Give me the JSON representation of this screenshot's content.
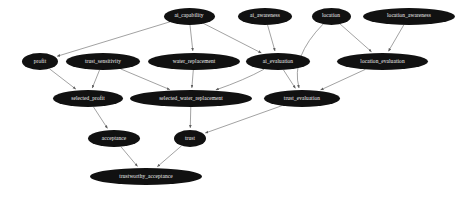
{
  "diagram": {
    "type": "directed-acyclic-graph",
    "background_color": "#ffffff",
    "node_fill_color": "#111111",
    "node_text_color": "#f2f2f2",
    "edge_color": "#7a7a7a",
    "nodes": [
      {
        "id": "ai_capability",
        "label": "ai_capability",
        "cx": 189.0,
        "cy": 16.0,
        "rx": 25.5,
        "ry": 8.5
      },
      {
        "id": "ai_awareness",
        "label": "ai_awareness",
        "cx": 265.0,
        "cy": 16.0,
        "rx": 27.0,
        "ry": 8.5
      },
      {
        "id": "location",
        "label": "location",
        "cx": 331.0,
        "cy": 16.0,
        "rx": 19.5,
        "ry": 8.5
      },
      {
        "id": "location_awareness",
        "label": "location_awareness",
        "cx": 409.0,
        "cy": 16.0,
        "rx": 46.0,
        "ry": 8.5
      },
      {
        "id": "profit",
        "label": "profit",
        "cx": 40.0,
        "cy": 61.5,
        "rx": 18.0,
        "ry": 8.5
      },
      {
        "id": "trust_sensitivity",
        "label": "trust_sensitivity",
        "cx": 103.0,
        "cy": 61.5,
        "rx": 37.0,
        "ry": 8.5
      },
      {
        "id": "water_replacement",
        "label": "water_replacement",
        "cx": 194.0,
        "cy": 61.5,
        "rx": 46.0,
        "ry": 8.5
      },
      {
        "id": "ai_evaluation",
        "label": "ai_evaluation",
        "cx": 278.0,
        "cy": 61.5,
        "rx": 32.0,
        "ry": 8.5
      },
      {
        "id": "location_evaluation",
        "label": "location_evaluation",
        "cx": 382.5,
        "cy": 61.5,
        "rx": 45.5,
        "ry": 8.5
      },
      {
        "id": "selected_profit",
        "label": "selected_profit",
        "cx": 88.0,
        "cy": 98.5,
        "rx": 35.0,
        "ry": 8.5
      },
      {
        "id": "selected_water_replacement",
        "label": "selected_water_replacement",
        "cx": 191.0,
        "cy": 98.5,
        "rx": 61.0,
        "ry": 8.5
      },
      {
        "id": "trust_evaluation",
        "label": "trust_evaluation",
        "cx": 302.0,
        "cy": 98.5,
        "rx": 38.0,
        "ry": 8.5
      },
      {
        "id": "acceptance",
        "label": "acceptance",
        "cx": 114.0,
        "cy": 138.5,
        "rx": 26.0,
        "ry": 8.5
      },
      {
        "id": "trust",
        "label": "trust",
        "cx": 190.0,
        "cy": 138.5,
        "rx": 16.0,
        "ry": 8.5
      },
      {
        "id": "trustworthy_acceptance",
        "label": "trustworthy_acceptance",
        "cx": 146.0,
        "cy": 176.5,
        "rx": 56.0,
        "ry": 8.5
      }
    ],
    "edges": [
      {
        "from": "ai_capability",
        "to": "profit"
      },
      {
        "from": "ai_capability",
        "to": "water_replacement"
      },
      {
        "from": "ai_capability",
        "to": "ai_evaluation"
      },
      {
        "from": "ai_awareness",
        "to": "ai_evaluation"
      },
      {
        "from": "location",
        "to": "location_evaluation"
      },
      {
        "from": "location",
        "to": "trust_evaluation"
      },
      {
        "from": "location_awareness",
        "to": "location_evaluation"
      },
      {
        "from": "profit",
        "to": "selected_profit"
      },
      {
        "from": "trust_sensitivity",
        "to": "selected_profit"
      },
      {
        "from": "trust_sensitivity",
        "to": "selected_water_replacement"
      },
      {
        "from": "water_replacement",
        "to": "selected_water_replacement"
      },
      {
        "from": "ai_evaluation",
        "to": "selected_water_replacement"
      },
      {
        "from": "ai_evaluation",
        "to": "trust_evaluation"
      },
      {
        "from": "location_evaluation",
        "to": "trust_evaluation"
      },
      {
        "from": "selected_profit",
        "to": "acceptance"
      },
      {
        "from": "selected_water_replacement",
        "to": "trust"
      },
      {
        "from": "trust_evaluation",
        "to": "trust"
      },
      {
        "from": "acceptance",
        "to": "trustworthy_acceptance"
      },
      {
        "from": "trust",
        "to": "trustworthy_acceptance"
      }
    ],
    "curved_edges": [
      {
        "from": "location",
        "to": "trust_evaluation",
        "bow": -26
      },
      {
        "from": "ai_evaluation",
        "to": "selected_water_replacement",
        "bow": 10
      }
    ]
  }
}
